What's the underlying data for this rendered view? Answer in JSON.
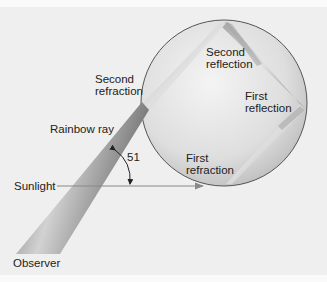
{
  "labels": {
    "second_reflection": "Second\nreflection",
    "second_refraction": "Second\nrefraction",
    "first_reflection": "First\nreflection",
    "rainbow_ray": "Rainbow ray",
    "angle": "51",
    "first_refraction": "First\nrefraction",
    "sunlight": "Sunlight",
    "observer": "Observer"
  },
  "colors": {
    "background": "#efefef",
    "drop_fill": "#d8d8d8",
    "drop_edge": "#555555",
    "beam": "#8a8a8a",
    "sunlight_arrow": "#7a7a7a"
  }
}
